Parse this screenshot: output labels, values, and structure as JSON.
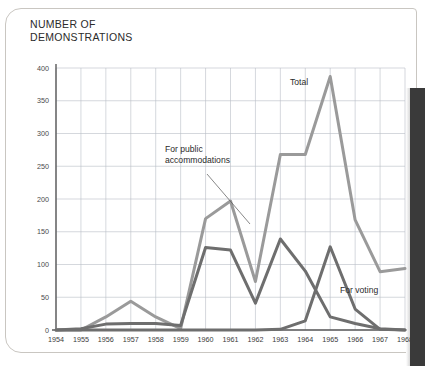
{
  "chart_title": "NUMBER OF\nDEMONSTRATIONS",
  "annotations": [
    {
      "id": "total",
      "label": "Total",
      "x": 290,
      "y": 85,
      "leader": false
    },
    {
      "id": "public",
      "label": "For public\naccommodations",
      "x": 165,
      "y": 152,
      "leader": true
    },
    {
      "id": "voting",
      "label": "For voting",
      "x": 340,
      "y": 293,
      "leader": false
    }
  ],
  "colors": {
    "total_line": "#9a9a9a",
    "public_line": "#6e6e6e",
    "voting_line": "#6e6e6e",
    "gridline": "#b9bec6",
    "axis": "#5a5a5a",
    "text": "#2b2b2b",
    "page_gutter": "#3a3a3a",
    "page_border": "#c9c6c1"
  },
  "chart_data": {
    "type": "line",
    "title": "NUMBER OF DEMONSTRATIONS",
    "xlabel": "",
    "ylabel": "NUMBER OF DEMONSTRATIONS",
    "xlim": [
      1954,
      1968
    ],
    "ylim": [
      0,
      400
    ],
    "grid": true,
    "legend_position": "inline-annotations",
    "categories": [
      1954,
      1955,
      1956,
      1957,
      1958,
      1959,
      1960,
      1961,
      1962,
      1963,
      1964,
      1965,
      1966,
      1967,
      1968
    ],
    "x": [
      1954,
      1955,
      1956,
      1957,
      1958,
      1959,
      1960,
      1961,
      1962,
      1963,
      1964,
      1965,
      1966,
      1967,
      1968
    ],
    "yticks": [
      0,
      50,
      100,
      150,
      200,
      250,
      300,
      350,
      400
    ],
    "xticks": [
      "1954",
      "1955",
      "1956",
      "1957",
      "1958",
      "1959",
      "1960",
      "1961",
      "1962",
      "1963",
      "1964",
      "1965",
      "1966",
      "1967",
      "1968"
    ],
    "series": [
      {
        "name": "Total",
        "color": "#9a9a9a",
        "values": [
          0,
          0,
          20,
          44,
          20,
          2,
          170,
          197,
          74,
          268,
          268,
          387,
          168,
          89,
          94
        ]
      },
      {
        "name": "For public accommodations",
        "color": "#6e6e6e",
        "values": [
          0,
          2,
          9,
          10,
          10,
          7,
          126,
          122,
          41,
          139,
          90,
          20,
          10,
          2,
          0
        ]
      },
      {
        "name": "For voting",
        "color": "#6e6e6e",
        "values": [
          0,
          0,
          0,
          0,
          0,
          0,
          0,
          0,
          0,
          1,
          14,
          127,
          32,
          1,
          0
        ]
      }
    ]
  }
}
